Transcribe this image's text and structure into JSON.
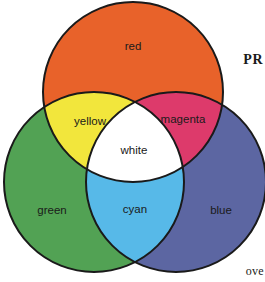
{
  "figure": {
    "type": "venn-diagram",
    "title_fragment_top_right": "PR",
    "title_fragment_bottom_right": "ove",
    "background_color": "#ffffff",
    "outline_color": "#1a1a1a"
  },
  "circles": [
    {
      "id": "red",
      "label": "red",
      "color": "#E8622A",
      "cx": 133,
      "cy": 92,
      "r": 90,
      "label_x": 133,
      "label_y": 47
    },
    {
      "id": "green",
      "label": "green",
      "color": "#52A254",
      "cx": 94,
      "cy": 182,
      "r": 90,
      "label_x": 52,
      "label_y": 211
    },
    {
      "id": "blue",
      "label": "blue",
      "color": "#5C66A2",
      "cx": 176,
      "cy": 182,
      "r": 90,
      "label_x": 221,
      "label_y": 211
    }
  ],
  "overlaps": [
    {
      "id": "yellow",
      "label": "yellow",
      "color": "#F2E63C",
      "sources": [
        "red",
        "green"
      ],
      "label_x": 90,
      "label_y": 122
    },
    {
      "id": "magenta",
      "label": "magenta",
      "color": "#DD3A6B",
      "sources": [
        "red",
        "blue"
      ],
      "label_x": 183,
      "label_y": 120
    },
    {
      "id": "cyan",
      "label": "cyan",
      "color": "#57B9E8",
      "sources": [
        "green",
        "blue"
      ],
      "label_x": 135,
      "label_y": 210
    },
    {
      "id": "white",
      "label": "white",
      "color": "#FFFFFF",
      "sources": [
        "red",
        "green",
        "blue"
      ],
      "label_x": 134,
      "label_y": 151
    }
  ]
}
